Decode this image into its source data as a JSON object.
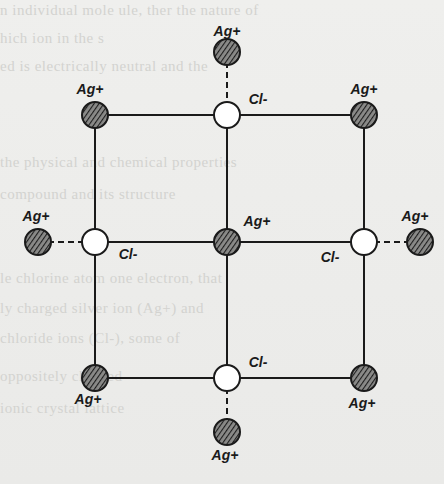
{
  "diagram": {
    "type": "crystal-lattice",
    "colors": {
      "background": "#ededeb",
      "line": "#1a1a1a",
      "cation_fill": "#555555",
      "anion_fill": "#ffffff"
    },
    "legend": {
      "cation": "Ag+",
      "anion": "Cl-"
    },
    "ions": [
      {
        "id": "ag-top",
        "label": "Ag+",
        "kind": "cation",
        "x": 227,
        "y": 52,
        "lx": 227,
        "ly": 36
      },
      {
        "id": "cl-top-center",
        "label": "Cl-",
        "kind": "anion",
        "x": 227,
        "y": 115,
        "lx": 258,
        "ly": 104
      },
      {
        "id": "ag-top-left",
        "label": "Ag+",
        "kind": "cation",
        "x": 95,
        "y": 115,
        "lx": 90,
        "ly": 94
      },
      {
        "id": "ag-top-right",
        "label": "Ag+",
        "kind": "cation",
        "x": 364,
        "y": 115,
        "lx": 364,
        "ly": 94
      },
      {
        "id": "ag-mid-far-left",
        "label": "Ag+",
        "kind": "cation",
        "x": 38,
        "y": 242,
        "lx": 36,
        "ly": 221
      },
      {
        "id": "cl-mid-left",
        "label": "Cl-",
        "kind": "anion",
        "x": 95,
        "y": 242,
        "lx": 128,
        "ly": 259
      },
      {
        "id": "ag-center",
        "label": "Ag+",
        "kind": "cation",
        "x": 227,
        "y": 242,
        "lx": 257,
        "ly": 226
      },
      {
        "id": "cl-mid-right",
        "label": "Cl-",
        "kind": "anion",
        "x": 364,
        "y": 242,
        "lx": 330,
        "ly": 262
      },
      {
        "id": "ag-mid-far-right",
        "label": "Ag+",
        "kind": "cation",
        "x": 420,
        "y": 242,
        "lx": 415,
        "ly": 221
      },
      {
        "id": "ag-bottom-left",
        "label": "Ag+",
        "kind": "cation",
        "x": 95,
        "y": 378,
        "lx": 88,
        "ly": 404
      },
      {
        "id": "cl-bottom-center",
        "label": "Cl-",
        "kind": "anion",
        "x": 227,
        "y": 378,
        "lx": 258,
        "ly": 367
      },
      {
        "id": "ag-bottom-right",
        "label": "Ag+",
        "kind": "cation",
        "x": 364,
        "y": 378,
        "lx": 362,
        "ly": 408
      },
      {
        "id": "ag-bottom",
        "label": "Ag+",
        "kind": "cation",
        "x": 227,
        "y": 432,
        "lx": 225,
        "ly": 460
      }
    ],
    "solid_bonds": [
      [
        "ag-top-left",
        "cl-top-center"
      ],
      [
        "cl-top-center",
        "ag-top-right"
      ],
      [
        "ag-top-left",
        "cl-mid-left"
      ],
      [
        "cl-top-center",
        "ag-center"
      ],
      [
        "ag-top-right",
        "cl-mid-right"
      ],
      [
        "cl-mid-left",
        "ag-center"
      ],
      [
        "ag-center",
        "cl-mid-right"
      ],
      [
        "cl-mid-left",
        "ag-bottom-left"
      ],
      [
        "ag-center",
        "cl-bottom-center"
      ],
      [
        "cl-mid-right",
        "ag-bottom-right"
      ],
      [
        "ag-bottom-left",
        "cl-bottom-center"
      ],
      [
        "cl-bottom-center",
        "ag-bottom-right"
      ]
    ],
    "dashed_bonds": [
      [
        "ag-top",
        "cl-top-center"
      ],
      [
        "ag-mid-far-left",
        "cl-mid-left"
      ],
      [
        "cl-mid-right",
        "ag-mid-far-right"
      ],
      [
        "cl-bottom-center",
        "ag-bottom"
      ]
    ]
  }
}
